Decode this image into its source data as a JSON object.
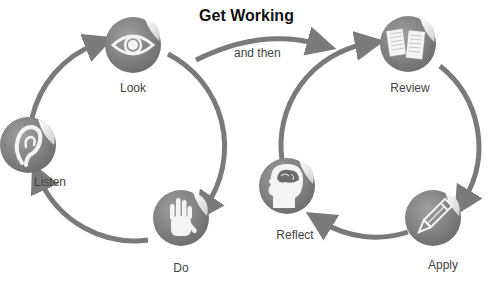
{
  "title": "Get Working",
  "connector": {
    "label": "and then"
  },
  "colors": {
    "arrow": "#7a7a7a",
    "badge": "#8a8a8a",
    "badge_dark": "#6e6e6e",
    "icon": "#f4f4f4",
    "text": "#444444",
    "title": "#111111"
  },
  "cycles": [
    {
      "name": "left-cycle",
      "steps": [
        {
          "label": "Look",
          "icon": "eye-icon"
        },
        {
          "label": "Do",
          "icon": "hand-icon"
        },
        {
          "label": "Listen",
          "icon": "ear-icon"
        }
      ]
    },
    {
      "name": "right-cycle",
      "steps": [
        {
          "label": "Review",
          "icon": "documents-icon"
        },
        {
          "label": "Apply",
          "icon": "pencil-icon"
        },
        {
          "label": "Reflect",
          "icon": "head-brain-icon"
        }
      ]
    }
  ]
}
